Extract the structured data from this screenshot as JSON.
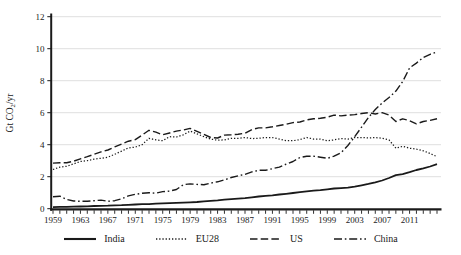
{
  "chart_data": {
    "type": "line",
    "title": "",
    "xlabel": "",
    "ylabel": "Gt CO2/yr",
    "ylabel_parts": {
      "pre": "Gt CO",
      "sub": "2",
      "post": "/yr"
    },
    "xlim": [
      1959,
      2015
    ],
    "ylim": [
      0,
      12
    ],
    "yticks": [
      0,
      2,
      4,
      6,
      8,
      10,
      12
    ],
    "xtick_labels": [
      1959,
      1963,
      1967,
      1971,
      1975,
      1979,
      1983,
      1987,
      1991,
      1995,
      1999,
      2003,
      2007,
      2011
    ],
    "grid": "horizontal-light",
    "legend_position": "bottom-center",
    "line_color": "#1a1a1a",
    "grid_color": "#dcdcdc",
    "x": [
      1959,
      1960,
      1961,
      1962,
      1963,
      1964,
      1965,
      1966,
      1967,
      1968,
      1969,
      1970,
      1971,
      1972,
      1973,
      1974,
      1975,
      1976,
      1977,
      1978,
      1979,
      1980,
      1981,
      1982,
      1983,
      1984,
      1985,
      1986,
      1987,
      1988,
      1989,
      1990,
      1991,
      1992,
      1993,
      1994,
      1995,
      1996,
      1997,
      1998,
      1999,
      2000,
      2001,
      2002,
      2003,
      2004,
      2005,
      2006,
      2007,
      2008,
      2009,
      2010,
      2011,
      2012,
      2013,
      2014,
      2015
    ],
    "series": [
      {
        "name": "India",
        "style": "solid",
        "values": [
          0.1,
          0.11,
          0.12,
          0.13,
          0.14,
          0.15,
          0.17,
          0.18,
          0.19,
          0.21,
          0.22,
          0.24,
          0.26,
          0.28,
          0.29,
          0.31,
          0.33,
          0.35,
          0.37,
          0.38,
          0.4,
          0.42,
          0.46,
          0.49,
          0.52,
          0.56,
          0.6,
          0.63,
          0.66,
          0.71,
          0.76,
          0.8,
          0.84,
          0.89,
          0.93,
          0.98,
          1.03,
          1.09,
          1.13,
          1.16,
          1.21,
          1.26,
          1.29,
          1.32,
          1.38,
          1.46,
          1.55,
          1.65,
          1.76,
          1.92,
          2.1,
          2.16,
          2.28,
          2.42,
          2.52,
          2.64,
          2.78
        ]
      },
      {
        "name": "EU28",
        "style": "dotted",
        "values": [
          2.45,
          2.6,
          2.65,
          2.8,
          2.95,
          3.0,
          3.1,
          3.15,
          3.22,
          3.4,
          3.6,
          3.8,
          3.85,
          4.0,
          4.4,
          4.3,
          4.25,
          4.5,
          4.48,
          4.62,
          4.85,
          4.68,
          4.5,
          4.35,
          4.28,
          4.3,
          4.4,
          4.4,
          4.45,
          4.38,
          4.4,
          4.45,
          4.45,
          4.35,
          4.25,
          4.25,
          4.32,
          4.45,
          4.35,
          4.35,
          4.25,
          4.3,
          4.38,
          4.35,
          4.45,
          4.45,
          4.42,
          4.45,
          4.4,
          4.3,
          3.78,
          3.9,
          3.78,
          3.72,
          3.62,
          3.45,
          3.25
        ]
      },
      {
        "name": "US",
        "style": "dashed",
        "values": [
          2.85,
          2.87,
          2.87,
          2.97,
          3.12,
          3.25,
          3.4,
          3.55,
          3.67,
          3.86,
          4.04,
          4.22,
          4.32,
          4.6,
          4.9,
          4.78,
          4.62,
          4.73,
          4.85,
          4.92,
          5.02,
          4.84,
          4.65,
          4.45,
          4.42,
          4.6,
          4.62,
          4.65,
          4.72,
          4.95,
          5.05,
          5.05,
          5.12,
          5.2,
          5.28,
          5.38,
          5.42,
          5.55,
          5.62,
          5.65,
          5.72,
          5.85,
          5.8,
          5.85,
          5.88,
          5.95,
          6.0,
          5.92,
          6.0,
          5.85,
          5.45,
          5.62,
          5.5,
          5.3,
          5.45,
          5.52,
          5.62
        ]
      },
      {
        "name": "China",
        "style": "dashdot",
        "values": [
          0.75,
          0.78,
          0.58,
          0.48,
          0.46,
          0.46,
          0.5,
          0.54,
          0.46,
          0.5,
          0.62,
          0.8,
          0.9,
          0.96,
          1.0,
          0.97,
          1.07,
          1.1,
          1.2,
          1.5,
          1.55,
          1.52,
          1.5,
          1.6,
          1.68,
          1.8,
          1.95,
          2.05,
          2.15,
          2.3,
          2.4,
          2.4,
          2.5,
          2.6,
          2.78,
          2.95,
          3.2,
          3.28,
          3.28,
          3.22,
          3.15,
          3.28,
          3.5,
          3.95,
          4.5,
          5.1,
          5.7,
          6.2,
          6.6,
          6.95,
          7.35,
          7.95,
          8.8,
          9.1,
          9.45,
          9.65,
          9.8
        ]
      }
    ]
  }
}
